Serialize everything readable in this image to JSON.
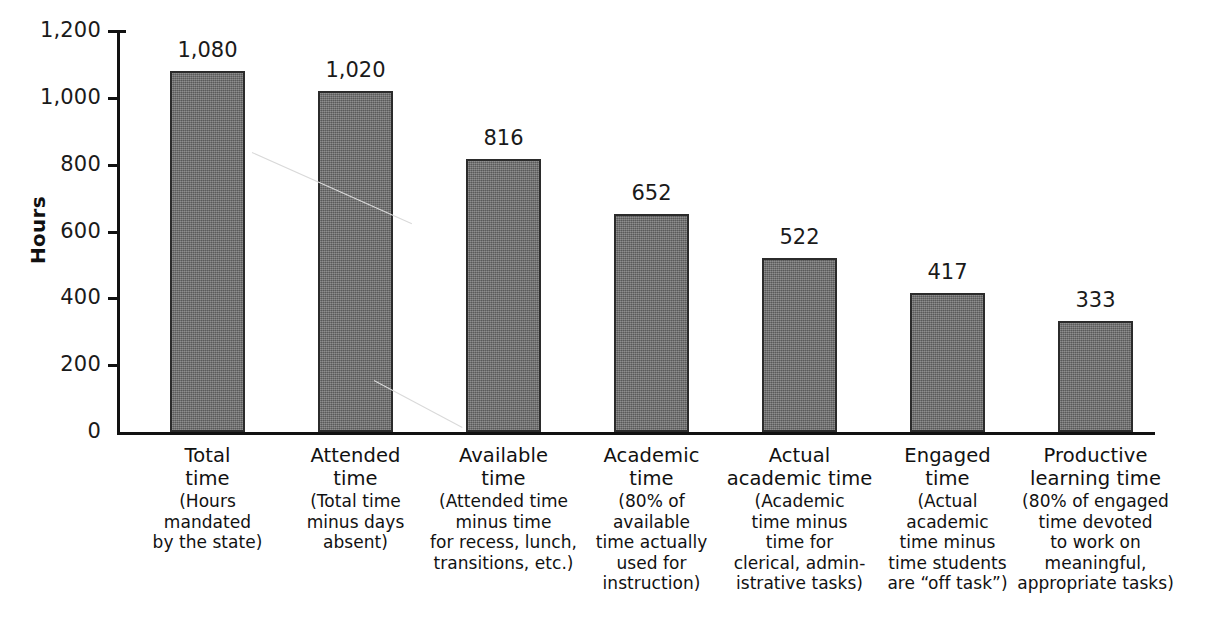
{
  "chart_data": {
    "type": "bar",
    "title": "",
    "xlabel": "",
    "ylabel": "Hours",
    "ylim": [
      0,
      1200
    ],
    "grid": false,
    "legend": "none",
    "categories": [
      "Total time",
      "Attended time",
      "Available time",
      "Academic time",
      "Actual academic time",
      "Engaged time",
      "Productive learning time"
    ],
    "values": [
      1080,
      1020,
      816,
      652,
      522,
      417,
      333
    ],
    "value_labels": [
      "1,080",
      "1,020",
      "816",
      "652",
      "522",
      "417",
      "333"
    ],
    "ytick_values": [
      0,
      200,
      400,
      600,
      800,
      1000,
      1200
    ],
    "ytick_labels": [
      "0",
      "200",
      "400",
      "600",
      "800",
      "1,000",
      "1,200"
    ],
    "bar_color": "#6d6d6d",
    "bar_border_color": "#2b2b2b",
    "axis_color": "#111111"
  },
  "axis": {
    "y_title": "Hours"
  },
  "bars": [
    {
      "title_line1": "Total",
      "title_line2": "time",
      "desc_line1": "(Hours",
      "desc_line2": "mandated",
      "desc_line3": "by the state)",
      "desc_line4": "",
      "desc_line5": "",
      "value_label": "1,080"
    },
    {
      "title_line1": "Attended",
      "title_line2": "time",
      "desc_line1": "(Total time",
      "desc_line2": "minus days",
      "desc_line3": "absent)",
      "desc_line4": "",
      "desc_line5": "",
      "value_label": "1,020"
    },
    {
      "title_line1": "Available",
      "title_line2": "time",
      "desc_line1": "(Attended time",
      "desc_line2": "minus time",
      "desc_line3": "for recess, lunch,",
      "desc_line4": "transitions, etc.)",
      "desc_line5": "",
      "value_label": "816"
    },
    {
      "title_line1": "Academic",
      "title_line2": "time",
      "desc_line1": "(80% of",
      "desc_line2": "available",
      "desc_line3": "time actually",
      "desc_line4": "used for",
      "desc_line5": "instruction)",
      "value_label": "652"
    },
    {
      "title_line1": "Actual",
      "title_line2": "academic time",
      "desc_line1": "(Academic",
      "desc_line2": "time minus",
      "desc_line3": "time for",
      "desc_line4": "clerical, admin-",
      "desc_line5": "istrative tasks)",
      "value_label": "522"
    },
    {
      "title_line1": "Engaged",
      "title_line2": "time",
      "desc_line1": "(Actual",
      "desc_line2": "academic",
      "desc_line3": "time minus",
      "desc_line4": "time students",
      "desc_line5": "are “off task”)",
      "value_label": "417"
    },
    {
      "title_line1": "Productive",
      "title_line2": "learning time",
      "desc_line1": "(80% of engaged",
      "desc_line2": "time devoted",
      "desc_line3": "to work on",
      "desc_line4": "meaningful,",
      "desc_line5": "appropriate tasks)",
      "value_label": "333"
    }
  ],
  "yticks": [
    {
      "label": "1,200"
    },
    {
      "label": "1,000"
    },
    {
      "label": "800"
    },
    {
      "label": "600"
    },
    {
      "label": "400"
    },
    {
      "label": "200"
    },
    {
      "label": "0"
    }
  ]
}
